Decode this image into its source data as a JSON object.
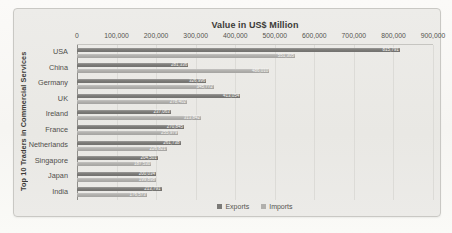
{
  "chart": {
    "panel_bg": "#eae9e5",
    "border_color": "#c9c8c4",
    "grid_color": "#dcdbd7",
    "axis_color": "#8f8e8a"
  },
  "chart_data": {
    "type": "bar",
    "orientation": "horizontal",
    "title": "Value in US$ Million",
    "xlabel": "Value in US$ Million",
    "ylabel": "Top 10 Traders in Commercial Services",
    "categories": [
      "USA",
      "China",
      "Germany",
      "UK",
      "Ireland",
      "France",
      "Netherlands",
      "Singapore",
      "Japan",
      "India"
    ],
    "series": [
      {
        "name": "Exports",
        "color": "#7b7a77",
        "values": [
          815791,
          281336,
          326996,
          413054,
          237063,
          270845,
          261738,
          204501,
          200034,
          213791
        ]
      },
      {
        "name": "Imports",
        "color": "#b1b0ad",
        "values": [
          551305,
          486010,
          345772,
          278402,
          313842,
          255979,
          226821,
          187530,
          199898,
          176573
        ]
      }
    ],
    "xlim": [
      0,
      900000
    ],
    "x_ticks": [
      0,
      100000,
      200000,
      300000,
      400000,
      500000,
      600000,
      700000,
      800000,
      900000
    ],
    "grid": true,
    "data_labels": true,
    "legend_position": "bottom",
    "data_label_color": "#f4f3f0"
  }
}
